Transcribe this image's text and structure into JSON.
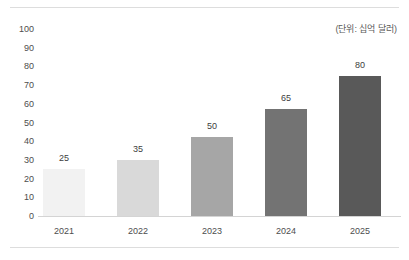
{
  "figure": {
    "clipped_caption": "",
    "unit_note": "(단위: 십억 달러)"
  },
  "chart_data": {
    "type": "bar",
    "title": "",
    "subtitle": "",
    "annotations": [
      "(단위: 십억 달러)"
    ],
    "xlabel": "",
    "ylabel": "",
    "categories": [
      "2021",
      "2022",
      "2023",
      "2024",
      "2025"
    ],
    "values": [
      25,
      35,
      50,
      65,
      80
    ],
    "value_labels": [
      "25",
      "35",
      "50",
      "65",
      "80"
    ],
    "bar_top_values": [
      25,
      30,
      42,
      57,
      75
    ],
    "bar_colors": [
      "#f2f2f2",
      "#d9d9d9",
      "#a6a6a6",
      "#737373",
      "#595959"
    ],
    "ylim": [
      0,
      100
    ],
    "ytick_labels": [
      "100",
      "90",
      "80",
      "70",
      "60",
      "50",
      "40",
      "30",
      "20",
      "10",
      "0"
    ],
    "ytick_values": [
      100,
      90,
      80,
      70,
      60,
      50,
      40,
      30,
      20,
      10,
      0
    ],
    "grid": false,
    "legend": false,
    "legend_position": "none",
    "axis_color": "#d4d4d4",
    "text_color": "#4d4d4d",
    "background": "#ffffff"
  }
}
